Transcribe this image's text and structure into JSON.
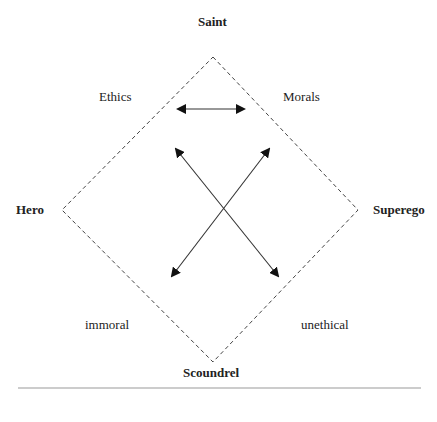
{
  "diagram": {
    "corners": {
      "top": "Saint",
      "left": "Hero",
      "right": "Superego",
      "bottom": "Scoundrel"
    },
    "quadrant_labels": {
      "upper_left": "Ethics",
      "upper_right": "Morals",
      "lower_left": "immoral",
      "lower_right": "unethical"
    },
    "shape": "dashed-diamond",
    "arrows": [
      {
        "from": "Ethics",
        "to": "Morals",
        "type": "bidirectional-horizontal"
      },
      {
        "from": "immoral",
        "to": "Morals",
        "type": "bidirectional-diagonal"
      },
      {
        "from": "Ethics",
        "to": "unethical",
        "type": "bidirectional-diagonal"
      }
    ],
    "colors": {
      "line": "#333333",
      "dash": "#444444",
      "rule": "#999999"
    }
  }
}
